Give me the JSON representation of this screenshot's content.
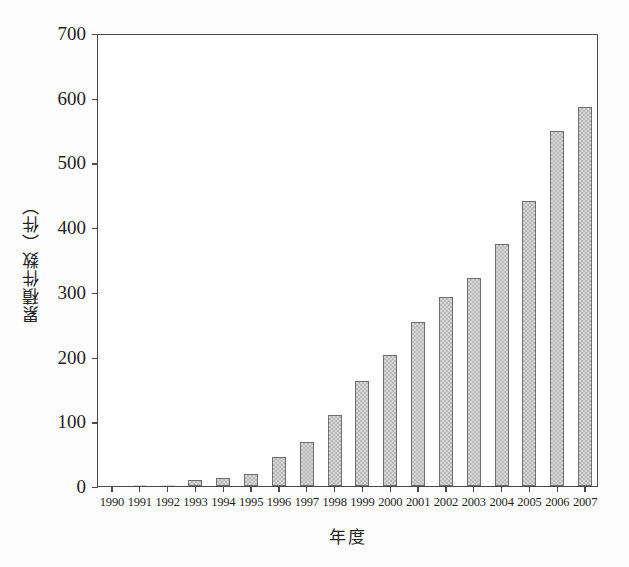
{
  "chart_data": {
    "type": "bar",
    "title": "",
    "subtitle": "",
    "xlabel": "年度",
    "ylabel": "累積件数（件）",
    "categories": [
      "1990",
      "1991",
      "1992",
      "1993",
      "1994",
      "1995",
      "1996",
      "1997",
      "1998",
      "1999",
      "2000",
      "2001",
      "2002",
      "2003",
      "2004",
      "2005",
      "2006",
      "2007"
    ],
    "values": [
      0,
      1,
      2,
      9,
      12,
      19,
      45,
      68,
      110,
      163,
      203,
      253,
      292,
      321,
      374,
      441,
      549,
      586
    ],
    "series": [
      {
        "name": "累積件数",
        "values": [
          0,
          1,
          2,
          9,
          12,
          19,
          45,
          68,
          110,
          163,
          203,
          253,
          292,
          321,
          374,
          441,
          549,
          586
        ]
      }
    ],
    "ylim": [
      0,
      700
    ],
    "yticks": [
      0,
      100,
      200,
      300,
      400,
      500,
      600,
      700
    ],
    "ytick_labels": [
      "0",
      "100",
      "200",
      "300",
      "400",
      "500",
      "600",
      "700"
    ],
    "xtick_labels": [
      "1990",
      "1991",
      "1992",
      "1993",
      "1994",
      "1995",
      "1996",
      "1997",
      "1998",
      "1999",
      "2000",
      "2001",
      "2002",
      "2003",
      "2004",
      "2005",
      "2006",
      "2007"
    ],
    "grid": false,
    "legend": false,
    "legend_position": "none",
    "bar_fill_color": "#d6d6d6",
    "bar_hatch_color": "#b9b9b9",
    "bar_edge_color": "#6d6d6d",
    "axis_color": "#4a4a4a",
    "background_color": "#ffffff",
    "annotations": []
  }
}
